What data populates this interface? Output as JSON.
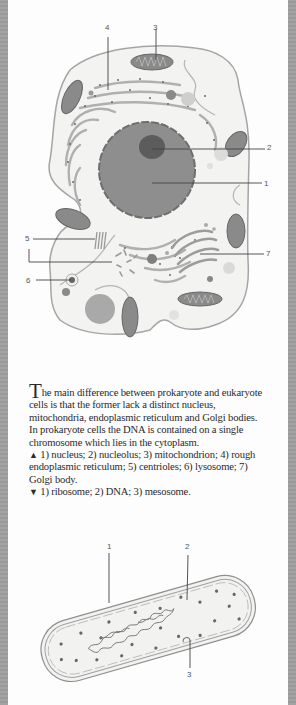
{
  "figure_top": {
    "title": "Eukaryote cell",
    "labels": [
      {
        "id": "1",
        "text": "1"
      },
      {
        "id": "2",
        "text": "2"
      },
      {
        "id": "3",
        "text": "3"
      },
      {
        "id": "4",
        "text": "4"
      },
      {
        "id": "5",
        "text": "5"
      },
      {
        "id": "6",
        "text": "6"
      },
      {
        "id": "7",
        "text": "7"
      }
    ]
  },
  "caption": {
    "dropcap": "T",
    "intro": "he main difference between prokaryote and eukaryote cells is that the former lack a distinct nucleus, mitochondria, endoplasmic reticulum and Golgi bodies. In prokaryote cells the DNA is contained on a single chromosome which lies in the cytoplasm.",
    "up_marker": "▲",
    "up_text": " 1) nucleus; 2) nucleolus; 3) mitochondrion; 4) rough endoplasmic reticulum; 5) centrioles; 6) lysosome; 7) Golgi body.",
    "down_marker": "▼",
    "down_text": " 1) ribosome; 2) DNA; 3) mesosome."
  },
  "figure_bottom": {
    "title": "Prokaryote cell",
    "labels": [
      {
        "id": "1",
        "text": "1"
      },
      {
        "id": "2",
        "text": "2"
      },
      {
        "id": "3",
        "text": "3"
      }
    ]
  },
  "colors": {
    "page": "#fdfdfd",
    "border": "#9e9e9e",
    "cytoplasm": "#f1f1ef",
    "outline": "#9a9a9a",
    "nucleus": "#8f8f8f",
    "nucleolus": "#5e5e5e",
    "organelle": "#7a7a7a",
    "text": "#2a2a2a"
  }
}
